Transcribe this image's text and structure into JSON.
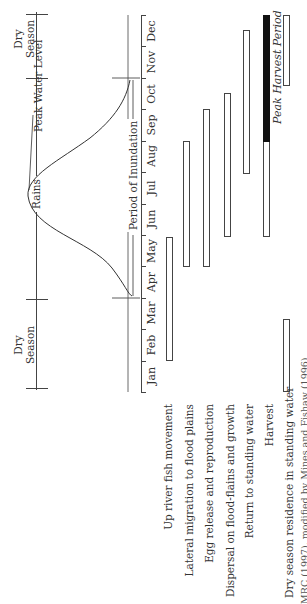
{
  "diagram": {
    "season_bands": [
      {
        "label_line1": "Dry",
        "label_line2": "Season",
        "position": "top"
      },
      {
        "label": "Rains"
      },
      {
        "label_line1": "Dry",
        "label_line2": "Season",
        "position": "bottom"
      }
    ],
    "curve_labels": {
      "peak_water_level": "Peak Water Level",
      "period_of_inundation": "Period of Inundation"
    },
    "months": [
      "Jan",
      "Feb",
      "Mar",
      "Apr",
      "May",
      "Jun",
      "Jul",
      "Aug",
      "Sep",
      "Oct",
      "Nov",
      "Dec"
    ],
    "activities": [
      {
        "label": "Up river fish movement",
        "start": "Feb",
        "end": "May"
      },
      {
        "label": "Lateral migration to flood plains",
        "start": "May",
        "end": "Aug"
      },
      {
        "label": "Egg release and reproduction",
        "start": "May",
        "end": "Sep"
      },
      {
        "label": "Dispersal on flood-flains and growth",
        "start": "Jun",
        "end": "Oct"
      },
      {
        "label": "Return to standing water",
        "start": "Aug",
        "end": "Dec"
      },
      {
        "label": "Harvest",
        "start": "Jun",
        "end": "Dec",
        "peak_start": "Sep",
        "peak_end": "Dec"
      },
      {
        "label": "Dry season residence in standing water",
        "segments": [
          [
            "Jan",
            "Apr"
          ],
          [
            "Nov",
            "Dec"
          ]
        ]
      }
    ],
    "peak_harvest_label": "Peak Harvest Period",
    "caption": "MRC (1997), modified by Mines and Fishaw (1996)"
  }
}
